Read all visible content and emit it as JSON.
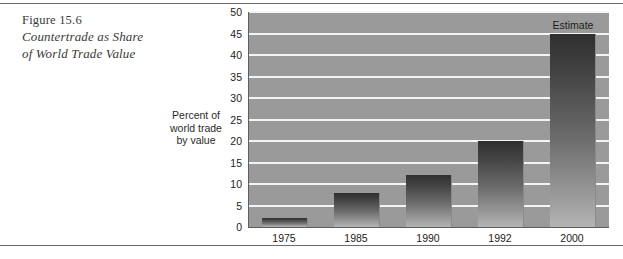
{
  "figure": {
    "number": "Figure 15.6",
    "title_line1": "Countertrade as Share",
    "title_line2": "of World Trade Value"
  },
  "axis_caption": {
    "line1": "Percent of",
    "line2": "world trade",
    "line3": "by value"
  },
  "chart_data": {
    "type": "bar",
    "title": "Countertrade as Share of World Trade Value",
    "xlabel": "",
    "ylabel": "Percent of world trade by value",
    "categories": [
      "1975",
      "1985",
      "1990",
      "1992",
      "2000"
    ],
    "values": [
      2,
      8,
      12,
      20,
      45
    ],
    "ylim": [
      0,
      50
    ],
    "yticks": [
      0,
      5,
      10,
      15,
      20,
      25,
      30,
      35,
      40,
      45,
      50
    ],
    "ytick_labels": [
      "0",
      "5",
      "10",
      "15",
      "20",
      "25",
      "30",
      "35",
      "40",
      "45",
      "50"
    ],
    "grid": true,
    "legend": false,
    "annotations": [
      {
        "text": "Estimate",
        "category": "2000",
        "value": 45
      }
    ],
    "colors": {
      "plot_background": "#9a9a9a",
      "gridline": "#f4f4f4",
      "bar_top": "#2f2f2f",
      "bar_bottom": "#b4b4b4",
      "axis": "#5d5d5d",
      "text": "#1c1c1c",
      "rule": "#6b6b6b"
    }
  }
}
